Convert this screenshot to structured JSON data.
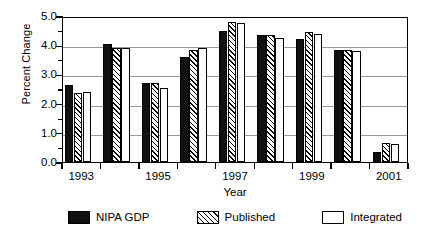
{
  "chart_data": {
    "type": "bar",
    "title": "",
    "subtitle": "",
    "xlabel": "Year",
    "ylabel": "Percent Change",
    "ylim": [
      0.0,
      5.0
    ],
    "ytick_step": 1.0,
    "yminor_step": 0.5,
    "grid": true,
    "grid_axis": "y",
    "legend_position": "bottom",
    "categories": [
      "1993",
      "1994",
      "1995",
      "1996",
      "1997",
      "1998",
      "1999",
      "2000",
      "2001"
    ],
    "xtick_labels": [
      "1993",
      "1995",
      "1997",
      "1999",
      "2001"
    ],
    "ytick_labels": [
      "0.0",
      "1.0",
      "2.0",
      "3.0",
      "4.0",
      "5.0"
    ],
    "series": [
      {
        "name": "NIPA GDP",
        "fill": "solid-black",
        "color": "#111111",
        "values": [
          2.65,
          4.05,
          2.7,
          3.6,
          4.5,
          4.35,
          4.2,
          3.85,
          0.35
        ]
      },
      {
        "name": "Published",
        "fill": "diagonal-hatch",
        "color": "#ffffff",
        "values": [
          2.35,
          3.9,
          2.7,
          3.85,
          4.8,
          4.35,
          4.45,
          3.85,
          0.65
        ]
      },
      {
        "name": "Integrated",
        "fill": "open-white",
        "color": "#ffffff",
        "values": [
          2.4,
          3.9,
          2.55,
          3.9,
          4.75,
          4.25,
          4.4,
          3.8,
          0.6
        ]
      }
    ]
  },
  "legend": {
    "entries": [
      {
        "label": "NIPA GDP",
        "swatch": "solid-black-swatch"
      },
      {
        "label": "Published",
        "swatch": "diagonal-hatch-swatch"
      },
      {
        "label": "Integrated",
        "swatch": "open-white-swatch"
      }
    ]
  },
  "axes": {
    "y_title": "Percent Change",
    "x_title": "Year"
  }
}
